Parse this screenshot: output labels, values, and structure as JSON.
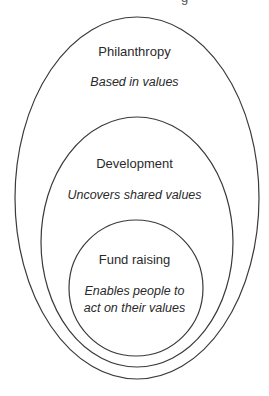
{
  "top_cut_text": "g",
  "layers": [
    {
      "name": "outer",
      "title": "Philanthropy",
      "description": "Based in values",
      "ellipse": {
        "cx": 137,
        "cy": 198,
        "rx": 122,
        "ry": 181
      }
    },
    {
      "name": "middle",
      "title": "Development",
      "description": "Uncovers shared values",
      "ellipse": {
        "cx": 137,
        "cy": 242,
        "rx": 96,
        "ry": 125
      }
    },
    {
      "name": "inner",
      "title": "Fund raising",
      "description_line1": "Enables people to",
      "description_line2": "act on their values",
      "ellipse": {
        "cx": 136,
        "cy": 288,
        "rx": 67,
        "ry": 68
      }
    }
  ],
  "colors": {
    "stroke": "#3a3a3a",
    "text": "#2a2a2a",
    "background": "#ffffff"
  }
}
